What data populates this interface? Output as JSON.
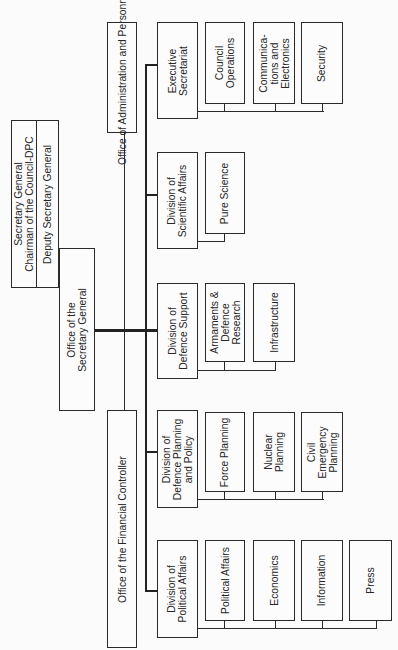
{
  "orientation": "rotated -90deg (chart reads bottom-to-top)",
  "top": {
    "secretary_general": "Secretary General\nChairman of the Council-DPC",
    "deputy": "Deputy Secretary General",
    "office_sg": "Office of the\nSecretary General"
  },
  "offices": {
    "admin_personnel": "Office of Administration and Personnel",
    "financial_controller": "Office of the Financial Controller"
  },
  "divisions": [
    {
      "name": "Executive\nSecretariat",
      "units": [
        "Council\nOperations",
        "Communica-\ntions and\nElectronics",
        "Security"
      ]
    },
    {
      "name": "Division of\nScientific Affairs",
      "units": [
        "Pure Science"
      ]
    },
    {
      "name": "Division of\nDefence Support",
      "units": [
        "Armaments &\nDefence\nResearch",
        "Infrastructure"
      ]
    },
    {
      "name": "Division of\nDefence Planning\nand Policy",
      "units": [
        "Force Planning",
        "Nuclear\nPlanning",
        "Civil\nEmergency\nPlanning"
      ]
    },
    {
      "name": "Division of\nPolitical Affairs",
      "units": [
        "Political Affairs",
        "Economics",
        "Information",
        "Press"
      ]
    }
  ]
}
